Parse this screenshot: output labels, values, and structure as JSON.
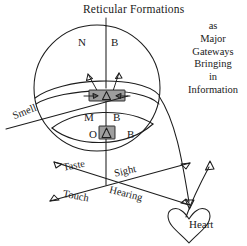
{
  "figure": {
    "title": "Reticular Formations",
    "side_caption_lines": [
      "as",
      "Major",
      "Gateways",
      "Bringing",
      "in",
      "Information"
    ],
    "side_caption_text": "as Major Gateways Bringing in Information",
    "brain_layers": [
      {
        "layer": "upper",
        "left_letter": "N",
        "right_letter": "B"
      },
      {
        "layer": "middle",
        "left_letter": "M",
        "right_letter": "B"
      },
      {
        "layer": "lower",
        "left_letter": "O",
        "right_letter": "B"
      }
    ],
    "letters": {
      "n": "N",
      "b_upper": "B",
      "m": "M",
      "b_middle": "B",
      "o": "O",
      "b_lower": "B"
    },
    "senses": {
      "smell": "Smell",
      "taste": "Taste",
      "sight": "Sight",
      "touch": "Touch",
      "hearing": "Hearing"
    },
    "heart_label": "Heart",
    "colors": {
      "ink": "#1d1d1d",
      "gate_fill": "#9e9e9e",
      "background": "#ffffff"
    }
  }
}
